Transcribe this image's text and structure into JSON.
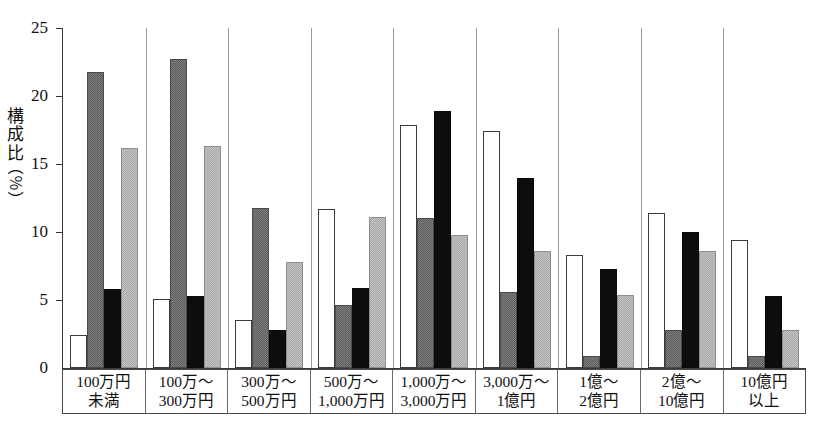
{
  "chart_data": {
    "type": "bar",
    "title": "",
    "subtitle": "",
    "xlabel": "",
    "ylabel": "構成比（％）",
    "ylabel_chars": [
      "構",
      "成",
      "比"
    ],
    "ylabel_unit": "（％）",
    "ylim": [
      0,
      25
    ],
    "yticks": [
      0,
      5,
      10,
      15,
      20,
      25
    ],
    "ytick_labels": [
      "0",
      "5",
      "10",
      "15",
      "20",
      "25"
    ],
    "grid": false,
    "legend_position": "none",
    "categories": [
      "100万円\n未満",
      "100万～\n300万円",
      "300万～\n500万円",
      "500万～\n1,000万円",
      "1,000万～\n3,000万円",
      "3,000万～\n1億円",
      "1億～\n2億円",
      "2億～\n10億円",
      "10億円\n以上"
    ],
    "category_lines": [
      [
        "100万円",
        "未満"
      ],
      [
        "100万～",
        "300万円"
      ],
      [
        "300万～",
        "500万円"
      ],
      [
        "500万～",
        "1,000万円"
      ],
      [
        "1,000万～",
        "3,000万円"
      ],
      [
        "3,000万～",
        "1億円"
      ],
      [
        "1億～",
        "2億円"
      ],
      [
        "2億～",
        "10億円"
      ],
      [
        "10億円",
        "以上"
      ]
    ],
    "series": [
      {
        "name": "series-1",
        "fill": "white",
        "color": "#ffffff",
        "values": [
          2.4,
          5.1,
          3.5,
          11.7,
          17.9,
          17.4,
          8.3,
          11.4,
          9.4
        ]
      },
      {
        "name": "series-2",
        "fill": "dark-gray",
        "color": "#6b6b6b",
        "values": [
          21.8,
          22.7,
          11.8,
          4.6,
          11.0,
          5.6,
          0.9,
          2.8,
          0.9
        ]
      },
      {
        "name": "series-3",
        "fill": "black",
        "color": "#0d0d0d",
        "values": [
          5.8,
          5.3,
          2.8,
          5.9,
          18.9,
          14.0,
          7.3,
          10.0,
          5.3
        ]
      },
      {
        "name": "series-4",
        "fill": "light-gray",
        "color": "#b4b4b4",
        "values": [
          16.2,
          16.3,
          7.8,
          11.1,
          9.8,
          8.6,
          5.4,
          8.6,
          2.8
        ]
      }
    ]
  }
}
